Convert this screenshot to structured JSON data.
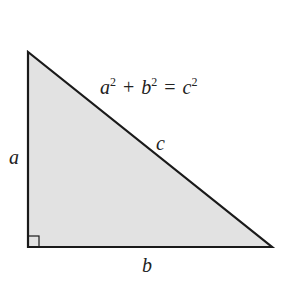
{
  "diagram": {
    "equation": {
      "a": "a",
      "a_exp": "2",
      "plus": "+",
      "b": "b",
      "b_exp": "2",
      "equals": "=",
      "c": "c",
      "c_exp": "2"
    },
    "labels": {
      "side_a": "a",
      "side_b": "b",
      "hypotenuse_c": "c"
    },
    "colors": {
      "fill": "#e2e2e2",
      "stroke": "#1a1a1a"
    }
  }
}
